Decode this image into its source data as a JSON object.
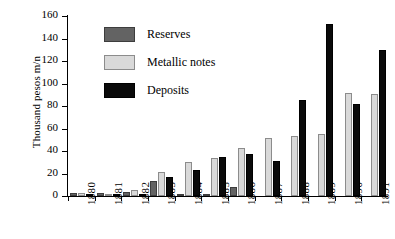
{
  "chart_data": {
    "type": "bar",
    "title": "",
    "xlabel": "",
    "ylabel": "Thousand pesos m/n",
    "ylim": [
      0,
      160
    ],
    "yticks": [
      0,
      20,
      40,
      60,
      80,
      100,
      120,
      140,
      160
    ],
    "grid": false,
    "legend_position": "upper-left-inside",
    "categories": [
      "1880",
      "1881",
      "1882",
      "1883",
      "1884",
      "1885",
      "1886",
      "1887",
      "1888",
      "1889",
      "1890",
      "1891"
    ],
    "series": [
      {
        "name": "Reserves",
        "color": "#636363",
        "values": [
          3,
          3,
          4,
          13,
          1,
          2,
          8,
          0,
          0,
          0,
          0,
          0
        ]
      },
      {
        "name": "Metallic notes",
        "color": "#d9d9d9",
        "values": [
          3,
          2,
          5,
          21,
          30,
          34,
          43,
          52,
          53,
          55,
          92,
          91
        ]
      },
      {
        "name": "Deposits",
        "color": "#0a0a0a",
        "values": [
          1,
          2,
          1,
          17,
          23,
          35,
          37,
          31,
          85,
          153,
          82,
          130
        ]
      }
    ]
  },
  "legend": {
    "items": [
      {
        "label": "Reserves",
        "swatch": "reserves"
      },
      {
        "label": "Metallic notes",
        "swatch": "notes"
      },
      {
        "label": "Deposits",
        "swatch": "deposits"
      }
    ]
  }
}
